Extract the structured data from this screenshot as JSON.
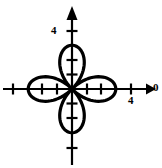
{
  "figure": {
    "title": "",
    "background_color": "#ffffff",
    "stroke_color": "#000000",
    "width": 162,
    "height": 168
  },
  "labels": {
    "y_tick_4": "4",
    "x_tick_4": "4",
    "origin_marker": "0"
  },
  "icons": {
    "x_axis_arrow": "arrow-right-icon",
    "y_axis_arrow": "arrow-up-icon"
  },
  "chart_data": {
    "type": "line",
    "subtype": "polar-rose",
    "title": "",
    "xlabel": "",
    "ylabel": "",
    "equation": "r = 3 cos(2θ)",
    "petal_count": 4,
    "petal_length": 3,
    "petal_half_width": 1.05,
    "petal_directions_deg": [
      0,
      90,
      180,
      270
    ],
    "xlim": [
      -5,
      5.5
    ],
    "ylim": [
      -4,
      5
    ],
    "grid": false,
    "legend": false,
    "origin_px": {
      "x": 72,
      "y": 89
    },
    "unit_px": 14.6,
    "axes": {
      "x": {
        "label_position": "right-end",
        "label": "0",
        "arrow": true,
        "ticks": [
          -4,
          -2,
          -1,
          1,
          2,
          4
        ],
        "labeled_ticks": [
          {
            "value": 4,
            "text": "4"
          }
        ],
        "tick_length_px": 11
      },
      "y": {
        "arrow": true,
        "ticks": [
          -4,
          -2,
          -1,
          1,
          2,
          4
        ],
        "labeled_ticks": [
          {
            "value": 4,
            "text": "4"
          }
        ],
        "tick_length_px": 11
      }
    },
    "curve": {
      "name": "four-petal rose",
      "stroke_width_px": 3.2,
      "closed": true,
      "points_theta_step_deg": 2
    }
  }
}
